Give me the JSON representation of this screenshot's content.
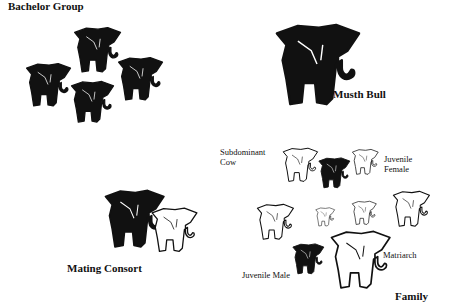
{
  "groups": {
    "bachelor": {
      "title": "Bachelor Group",
      "count": 4,
      "fill": "#111111"
    },
    "musth": {
      "title": "Musth Bull",
      "count": 1,
      "fill": "#111111"
    },
    "consort": {
      "title": "Mating Consort",
      "bull_fill": "#111111",
      "cow_fill": "#ffffff"
    },
    "family": {
      "title": "Family",
      "members": {
        "subdominant_cow": "Subdominant\nCow",
        "subdominant_cow_line1": "Subdominant",
        "subdominant_cow_line2": "Cow",
        "juvenile_female_line1": "Juvenile",
        "juvenile_female_line2": "Female",
        "juvenile_male": "Juvenile Male",
        "matriarch": "Matriarch"
      },
      "female_fill": "#ffffff",
      "male_fill": "#111111"
    }
  }
}
